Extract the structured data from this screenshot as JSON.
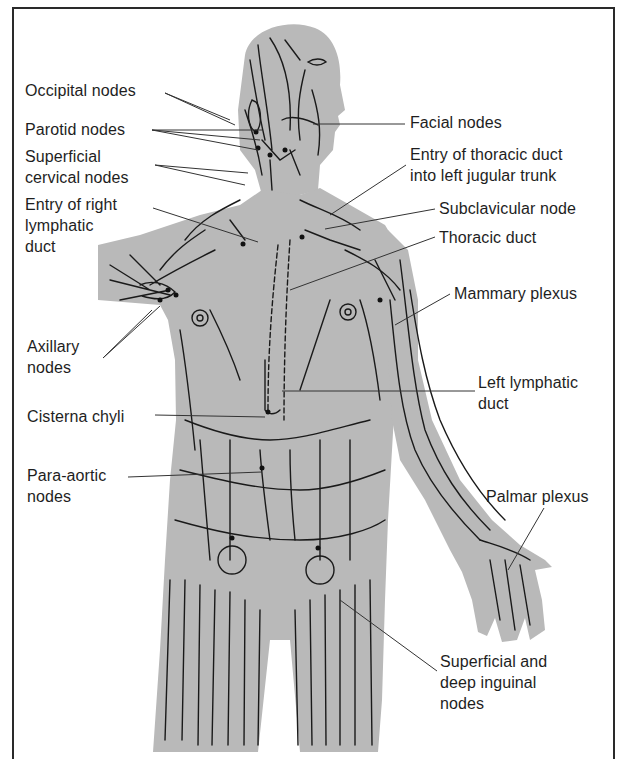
{
  "figure": {
    "colors": {
      "background": "#ffffff",
      "body_fill": "#b9b9b9",
      "vessel_stroke": "#1a1a1a",
      "leader_line": "#333333",
      "text": "#1e1e1e",
      "frame": "#2a2a2a"
    }
  },
  "labels": [
    {
      "id": "occipital-nodes",
      "text": "Occipital nodes",
      "x": 25,
      "y": 80
    },
    {
      "id": "parotid-nodes",
      "text": "Parotid nodes",
      "x": 25,
      "y": 119
    },
    {
      "id": "superficial-cervical-nodes",
      "text": "Superficial\ncervical nodes",
      "x": 25,
      "y": 146
    },
    {
      "id": "entry-right-lymphatic-duct",
      "text": "Entry of right\nlymphatic\nduct",
      "x": 25,
      "y": 194
    },
    {
      "id": "axillary-nodes",
      "text": "Axillary\nnodes",
      "x": 27,
      "y": 336
    },
    {
      "id": "cisterna-chyli",
      "text": "Cisterna chyli",
      "x": 27,
      "y": 406
    },
    {
      "id": "para-aortic-nodes",
      "text": "Para-aortic\nnodes",
      "x": 27,
      "y": 465
    },
    {
      "id": "facial-nodes",
      "text": "Facial nodes",
      "x": 410,
      "y": 112
    },
    {
      "id": "entry-thoracic-duct",
      "text": "Entry of thoracic duct\ninto left jugular trunk",
      "x": 410,
      "y": 144
    },
    {
      "id": "subclavicular-node",
      "text": "Subclavicular node",
      "x": 439,
      "y": 198
    },
    {
      "id": "thoracic-duct",
      "text": "Thoracic duct",
      "x": 439,
      "y": 227
    },
    {
      "id": "mammary-plexus",
      "text": "Mammary plexus",
      "x": 454,
      "y": 283
    },
    {
      "id": "left-lymphatic-duct",
      "text": "Left lymphatic\nduct",
      "x": 478,
      "y": 372
    },
    {
      "id": "palmar-plexus",
      "text": "Palmar plexus",
      "x": 486,
      "y": 486
    },
    {
      "id": "superficial-deep-inguinal-nodes",
      "text": "Superficial and\ndeep inguinal\nnodes",
      "x": 440,
      "y": 651
    }
  ]
}
